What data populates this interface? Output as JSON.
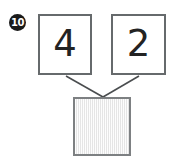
{
  "problem": {
    "number_badge": "10",
    "type": "number-bond",
    "addends": [
      {
        "value": "4"
      },
      {
        "value": "2"
      }
    ],
    "sum": {
      "value": "",
      "filled": false
    }
  },
  "colors": {
    "badge_fill": "#1a1a1a",
    "badge_text": "#ffffff",
    "box_border": "#666a6c",
    "answer_box_border": "#7d8082",
    "answer_box_fill": "#efefef",
    "digit_color": "#232323",
    "connector_line": "#4a4d4f",
    "background": "#ffffff"
  }
}
